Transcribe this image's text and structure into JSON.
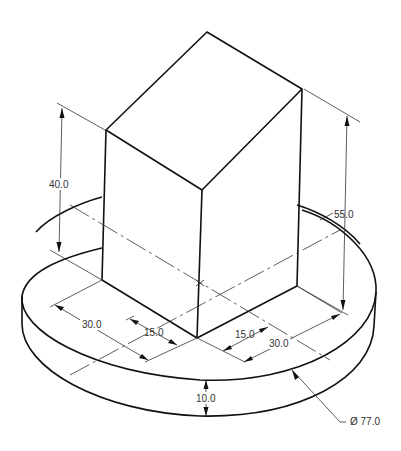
{
  "drawing": {
    "type": "isometric technical drawing",
    "subject": "rectangular block on circular base",
    "colors": {
      "line": "#111111",
      "dimension": "#333333",
      "background": "#ffffff"
    }
  },
  "dimensions": {
    "block_left_height": "40.0",
    "block_right_height": "55.0",
    "left_depth_outer": "30.0",
    "left_depth_inner": "15.0",
    "right_depth_inner": "15.0",
    "right_depth_outer": "30.0",
    "base_thickness": "10.0",
    "base_diameter": "Ø 77.0"
  }
}
